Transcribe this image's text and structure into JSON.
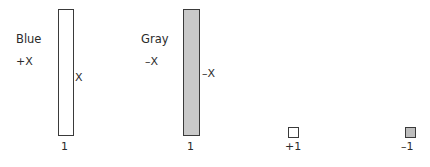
{
  "figure": {
    "title": "",
    "background_color": "#ffffff",
    "outline_color": "#3a3a3a",
    "text_color": "#2b2b2b"
  },
  "bars": [
    {
      "name": "blue",
      "label": "Blue",
      "sign_label": "+X",
      "side_label": "X",
      "base_label": "1",
      "fill_color": "#ffffff",
      "value": 1
    },
    {
      "name": "gray",
      "label": "Gray",
      "sign_label": "–X",
      "side_label": "–X",
      "base_label": "1",
      "fill_color": "#c9c9c9",
      "value": 1
    }
  ],
  "swatches": [
    {
      "name": "plus-one",
      "label": "+1",
      "fill_color": "#ffffff"
    },
    {
      "name": "minus-one",
      "label": "–1",
      "fill_color": "#bdbdbd"
    }
  ],
  "chart_data": {
    "type": "bar",
    "title": "",
    "xlabel": "",
    "ylabel": "",
    "categories": [
      "Blue",
      "Gray",
      "+1",
      "–1"
    ],
    "values": [
      1,
      1,
      0.09,
      0.09
    ],
    "bar_labels": [
      "1",
      "1",
      "+1",
      "–1"
    ],
    "series": [
      {
        "name": "magnitude",
        "values": [
          1,
          1,
          0.09,
          0.09
        ]
      }
    ],
    "annotations": [
      {
        "target": "Blue",
        "position": "left-top",
        "text": "Blue"
      },
      {
        "target": "Blue",
        "position": "left-middle",
        "text": "+X"
      },
      {
        "target": "Blue",
        "position": "right-middle",
        "text": "X"
      },
      {
        "target": "Blue",
        "position": "below",
        "text": "1"
      },
      {
        "target": "Gray",
        "position": "left-top",
        "text": "Gray"
      },
      {
        "target": "Gray",
        "position": "left-middle",
        "text": "–X"
      },
      {
        "target": "Gray",
        "position": "right-middle",
        "text": "–X"
      },
      {
        "target": "Gray",
        "position": "below",
        "text": "1"
      },
      {
        "target": "+1",
        "position": "below",
        "text": "+1"
      },
      {
        "target": "–1",
        "position": "below",
        "text": "–1"
      }
    ],
    "colors": [
      "#ffffff",
      "#c9c9c9",
      "#ffffff",
      "#bdbdbd"
    ],
    "grid": false,
    "legend": false,
    "ylim": [
      0,
      1.1
    ]
  }
}
